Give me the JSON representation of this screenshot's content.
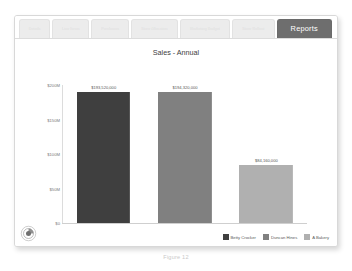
{
  "window": {
    "tabs": [
      {
        "label": "Details",
        "active": false
      },
      {
        "label": "Line Items",
        "active": false
      },
      {
        "label": "Purchases",
        "active": false
      },
      {
        "label": "Store Allocation",
        "active": false
      },
      {
        "label": "Marketing Budget",
        "active": false
      },
      {
        "label": "Store Rollout",
        "active": false
      },
      {
        "label": "Reports",
        "active": true
      }
    ],
    "logo_icon": "circle-swirl-logo-icon"
  },
  "caption": "Figure 12",
  "colors": {
    "active_tab_bg": "#6e6e6e",
    "inactive_tab_bg": "#ececec",
    "series_1": "#3f3f3f",
    "series_2": "#808080",
    "series_3": "#b0b0b0",
    "axis": "#dcdcdc",
    "text": "#5a5a5a"
  },
  "chart_data": {
    "type": "bar",
    "title": "Sales - Annual",
    "xlabel": "",
    "ylabel": "",
    "categories": [
      "Betty Crocker",
      "Duncan Hines",
      "A Bakery"
    ],
    "values": [
      193520000,
      194320000,
      84160000
    ],
    "value_labels": [
      "$193,520,000",
      "$194,320,000",
      "$84,160,000"
    ],
    "ylim": [
      0,
      200000000
    ],
    "yticks": [
      0,
      50000000,
      100000000,
      150000000,
      200000000
    ],
    "ytick_labels": [
      "$0",
      "$50M",
      "$100M",
      "$150M",
      "$200M"
    ],
    "grid": false,
    "legend_position": "bottom-right",
    "series_colors": [
      "#3f3f3f",
      "#808080",
      "#b0b0b0"
    ],
    "legend": [
      {
        "name": "Betty Crocker",
        "color": "#3f3f3f"
      },
      {
        "name": "Duncan Hines",
        "color": "#808080"
      },
      {
        "name": "A Bakery",
        "color": "#b0b0b0"
      }
    ]
  }
}
